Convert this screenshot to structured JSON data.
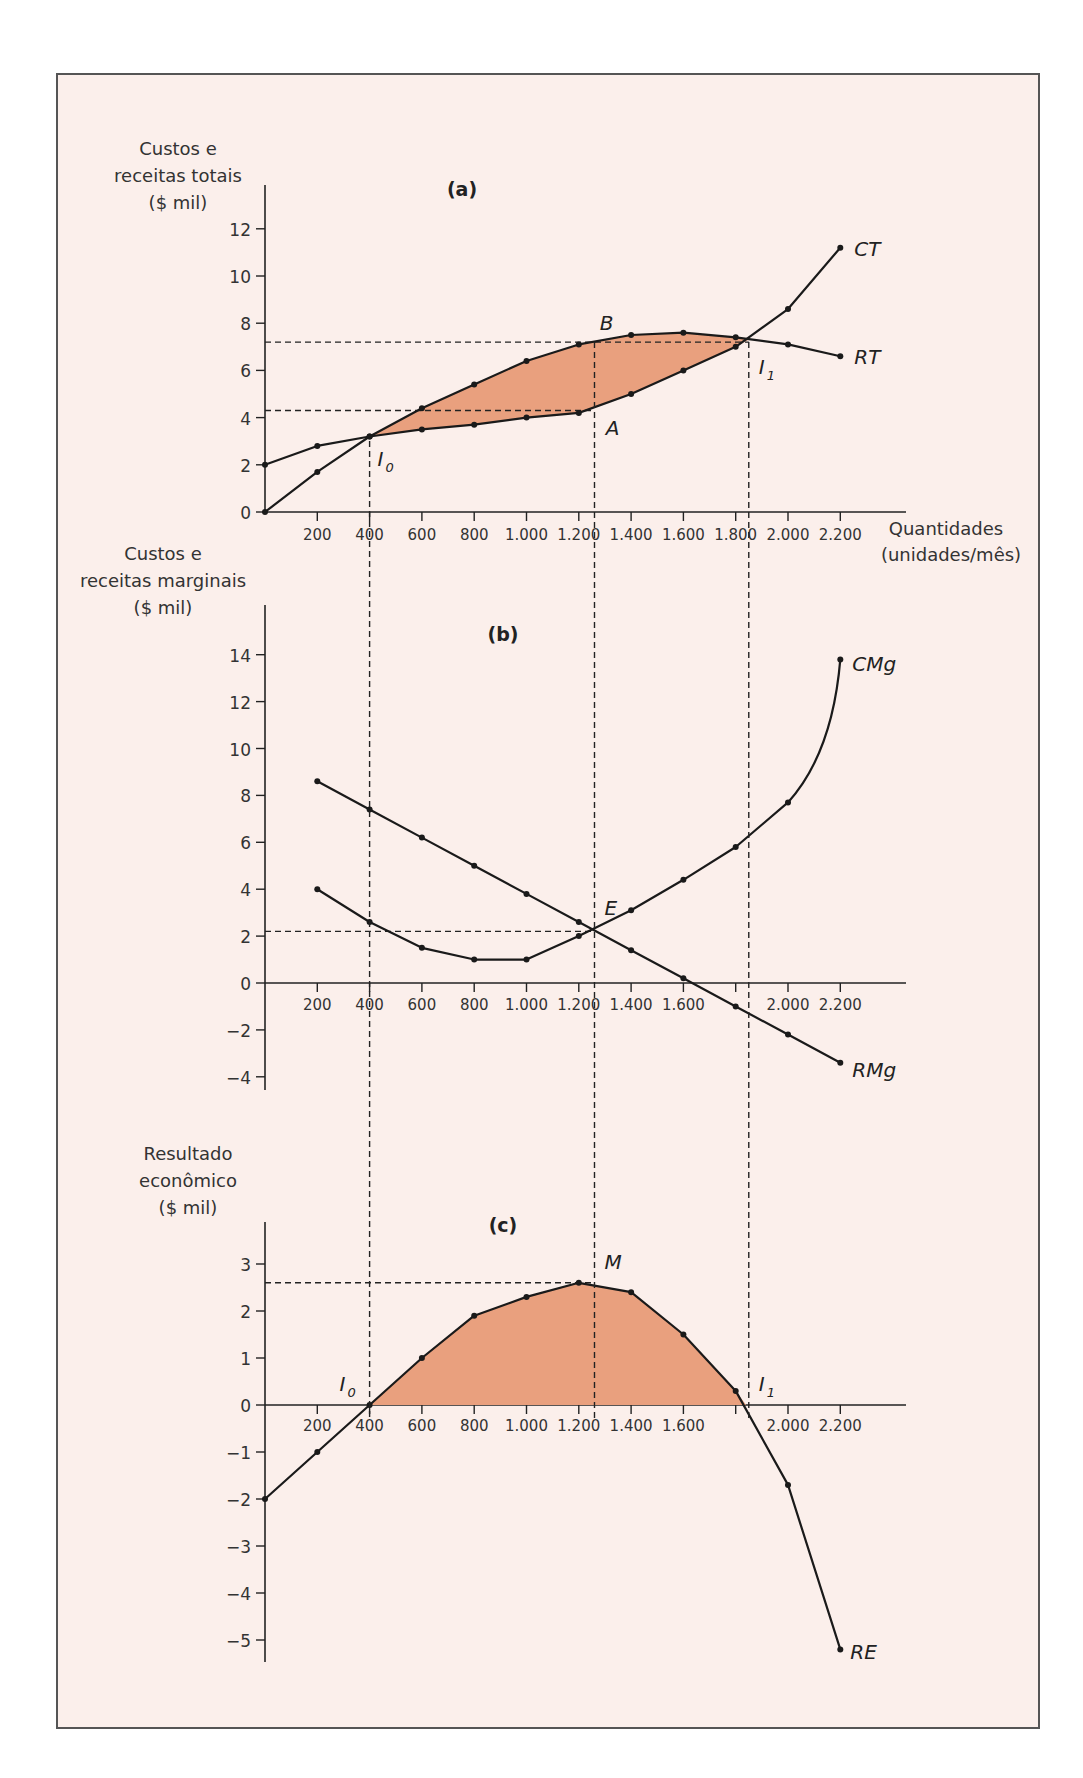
{
  "chart_data": [
    {
      "panel": "(a)",
      "type": "line",
      "title": "(a)",
      "ylabel": "Custos e receitas totais ($ mil)",
      "xlabel": "Quantidades (unidades/mês)",
      "x": [
        0,
        200,
        400,
        600,
        800,
        1000,
        1200,
        1400,
        1600,
        1800,
        2000,
        2200
      ],
      "x_tick_labels": [
        "200",
        "400",
        "600",
        "800",
        "1.000",
        "1.200",
        "1.400",
        "1.600",
        "1.800",
        "2.000",
        "2.200"
      ],
      "y_ticks": [
        0,
        2,
        4,
        6,
        8,
        10,
        12
      ],
      "ylim": [
        0,
        13
      ],
      "series": [
        {
          "name": "CT",
          "values": [
            2.0,
            2.8,
            3.2,
            3.5,
            3.7,
            4.0,
            4.2,
            5.0,
            6.0,
            7.0,
            8.6,
            11.2
          ]
        },
        {
          "name": "RT",
          "values": [
            0.0,
            1.7,
            3.2,
            4.4,
            5.4,
            6.4,
            7.1,
            7.5,
            7.6,
            7.4,
            7.1,
            6.6
          ]
        }
      ],
      "annotations": [
        {
          "label": "I0",
          "x": 400,
          "y": 3.2
        },
        {
          "label": "I1",
          "x": 1850,
          "y": 7.3
        },
        {
          "label": "B",
          "x": 1260,
          "y": 7.2
        },
        {
          "label": "A",
          "x": 1260,
          "y": 4.3
        }
      ],
      "shaded_region": "between RT and CT from I0 to I1 (profit area)"
    },
    {
      "panel": "(b)",
      "type": "line",
      "title": "(b)",
      "ylabel": "Custos e receitas marginais ($ mil)",
      "x": [
        200,
        400,
        600,
        800,
        1000,
        1200,
        1400,
        1600,
        1800,
        2000,
        2200
      ],
      "x_tick_labels": [
        "200",
        "400",
        "600",
        "800",
        "1.000",
        "1.200",
        "1.400",
        "1.600",
        "2.000",
        "2.200"
      ],
      "y_ticks": [
        -4,
        -2,
        0,
        2,
        4,
        6,
        8,
        10,
        12,
        14
      ],
      "ylim": [
        -4,
        15
      ],
      "series": [
        {
          "name": "CMg",
          "values": [
            4.0,
            2.6,
            1.5,
            1.0,
            1.0,
            2.0,
            3.1,
            4.4,
            5.8,
            7.7,
            13.8
          ]
        },
        {
          "name": "RMg",
          "values": [
            8.6,
            7.4,
            6.2,
            5.0,
            3.8,
            2.6,
            1.4,
            0.2,
            -1.0,
            -2.2,
            -3.4
          ]
        }
      ],
      "annotations": [
        {
          "label": "E",
          "x": 1260,
          "y": 2.2
        }
      ]
    },
    {
      "panel": "(c)",
      "type": "line",
      "title": "(c)",
      "ylabel": "Resultado econômico ($ mil)",
      "x": [
        0,
        200,
        400,
        600,
        800,
        1000,
        1200,
        1400,
        1600,
        1800,
        2000,
        2200
      ],
      "x_tick_labels": [
        "200",
        "400",
        "600",
        "800",
        "1.000",
        "1.200",
        "1.400",
        "1.600",
        "2.000",
        "2.200"
      ],
      "y_ticks": [
        -5,
        -4,
        -3,
        -2,
        -1,
        0,
        1,
        2,
        3
      ],
      "ylim": [
        -5.4,
        3.8
      ],
      "series": [
        {
          "name": "RE",
          "values": [
            -2.0,
            -1.0,
            0.0,
            1.0,
            1.9,
            2.3,
            2.6,
            2.4,
            1.5,
            0.3,
            -1.7,
            -5.2
          ]
        }
      ],
      "annotations": [
        {
          "label": "I0",
          "x": 400,
          "y": 0
        },
        {
          "label": "I1",
          "x": 1850,
          "y": 0
        },
        {
          "label": "M",
          "x": 1260,
          "y": 2.6
        }
      ],
      "shaded_region": "under RE above 0 between I0 and I1"
    }
  ],
  "labels": {
    "a_ylabel": [
      "Custos e",
      "receitas totais",
      "($ mil)"
    ],
    "b_ylabel": [
      "Custos e",
      "receitas marginais",
      "($ mil)"
    ],
    "c_ylabel": [
      "Resultado",
      "econômico",
      "($ mil)"
    ],
    "xlabel": [
      "Quantidades",
      "(unidades/mês)"
    ],
    "panel_a": "(a)",
    "panel_b": "(b)",
    "panel_c": "(c)"
  },
  "colors": {
    "fill": "#e9a07e",
    "background": "#fbefeb",
    "line": "#1a1a1a"
  }
}
